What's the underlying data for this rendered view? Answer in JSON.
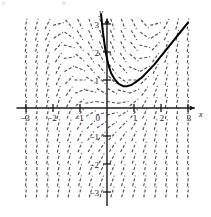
{
  "figure": {
    "background_color": "#ffffff",
    "ink_color": "#1a1a1a",
    "field_color": "#4a4a4a",
    "curve_color": "#000000",
    "width": 211,
    "height": 217
  },
  "corner_marks": {
    "top_left": "y'",
    "top_mid": "b"
  },
  "axes": {
    "x_axis_label": "x",
    "y_axis_label": "y",
    "origin_label": "0",
    "x_ticks": [
      {
        "value": -3,
        "label": "−3"
      },
      {
        "value": -2,
        "label": "−2"
      },
      {
        "value": -1,
        "label": "−1"
      },
      {
        "value": 1,
        "label": "1"
      },
      {
        "value": 2,
        "label": "2"
      },
      {
        "value": 3,
        "label": "3"
      }
    ],
    "y_ticks": [
      {
        "value": 3,
        "label": "3"
      },
      {
        "value": 2,
        "label": "2"
      },
      {
        "value": 1,
        "label": "1"
      },
      {
        "value": -1,
        "label": "−1"
      },
      {
        "value": -2,
        "label": "−2"
      },
      {
        "value": -3,
        "label": "−3"
      }
    ]
  },
  "chart_data": {
    "type": "line",
    "title": "",
    "subtitle": "",
    "xlabel": "x",
    "ylabel": "y",
    "xlim": [
      -3.2,
      3.2
    ],
    "ylim": [
      -3.4,
      3.4
    ],
    "grid": false,
    "legend": null,
    "annotations": [],
    "direction_field": {
      "description": "Slope field of a first-order differential equation; short dashed line segments on a lattice indicate dy/dx at each point.",
      "slope_formula": "x*x - y",
      "x_samples": [
        -3.0,
        -2.6,
        -2.2,
        -1.8,
        -1.4,
        -1.0,
        -0.6,
        -0.2,
        0.2,
        0.6,
        1.0,
        1.4,
        1.8,
        2.2,
        2.6,
        3.0
      ],
      "y_samples": [
        3.0,
        2.6,
        2.2,
        1.8,
        1.4,
        1.0,
        0.6,
        0.2,
        -0.2,
        -0.6,
        -1.0,
        -1.4,
        -1.8,
        -2.2,
        -2.6,
        -3.0
      ],
      "segment_length_px": 11,
      "dash_pattern": "3 2",
      "stroke_width": 1.1,
      "color": "#4a4a4a"
    },
    "series": [
      {
        "name": "solution curve",
        "kind": "curve",
        "color": "#000000",
        "stroke_width": 2.0,
        "x": [
          -0.22,
          -0.15,
          -0.05,
          0.05,
          0.15,
          0.3,
          0.45,
          0.6,
          0.75,
          0.9,
          1.1,
          1.3,
          1.5,
          1.75,
          2.0,
          2.25,
          2.5,
          2.75,
          3.0
        ],
        "y": [
          3.35,
          2.7,
          2.0,
          1.55,
          1.25,
          1.0,
          0.85,
          0.78,
          0.78,
          0.82,
          0.95,
          1.1,
          1.3,
          1.55,
          1.85,
          2.15,
          2.45,
          2.75,
          3.05
        ]
      }
    ]
  }
}
